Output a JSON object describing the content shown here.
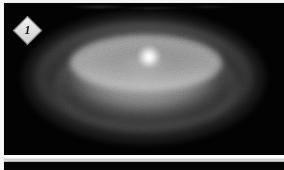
{
  "figure": {
    "panel_label": "1",
    "panel_label_shape": "diamond-badge",
    "media_type": "grayscale astronomical image",
    "background_color": "#020202",
    "badge_fill_color": "#e8e8e8",
    "badge_text_color": "#1a1a1a",
    "page_background_color": "#ffffff",
    "subject": {
      "name": "face-on ringed disk",
      "core_label": "bright nucleus",
      "features": [
        "bright point-like nucleus",
        "bright inner ring",
        "dark annular gap",
        "broad diffuse outer disk"
      ]
    },
    "icons": {
      "panel_badge": "diamond-number-badge"
    }
  },
  "panels": [
    {
      "index": "1",
      "label": "1",
      "state": "visible"
    },
    {
      "index": "2",
      "label": "",
      "state": "partially-visible"
    }
  ]
}
